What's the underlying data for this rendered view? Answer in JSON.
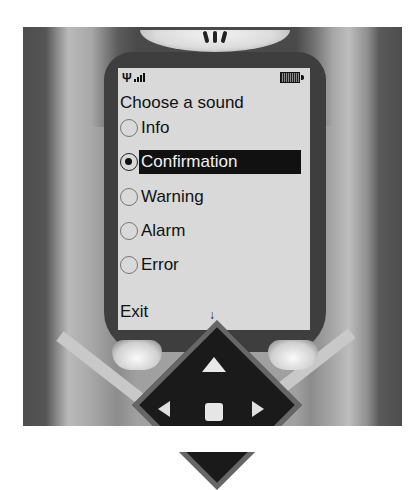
{
  "device": {
    "type": "mobile-phone",
    "earpiece_slots": 3
  },
  "status_bar": {
    "signal_icon": "antenna-icon",
    "signal_bars": 4,
    "battery_icon": "battery-icon",
    "battery_level": "full"
  },
  "screen": {
    "title": "Choose a sound",
    "options": [
      {
        "label": "Info",
        "selected": false
      },
      {
        "label": "Confirmation",
        "selected": true
      },
      {
        "label": "Warning",
        "selected": false
      },
      {
        "label": "Alarm",
        "selected": false
      },
      {
        "label": "Error",
        "selected": false
      }
    ],
    "softkey_left": "Exit",
    "scroll_indicator": "↓"
  },
  "keys": {
    "left_softkey": "left-softkey",
    "right_softkey": "right-softkey",
    "dpad_up": "▲",
    "dpad_left": "◀",
    "dpad_right": "▶",
    "dpad_center": "select"
  },
  "colors": {
    "screen_bg": "#d9d9d9",
    "selection_bg": "#111111",
    "selection_fg": "#f2f2f2",
    "bezel": "#3e3e3e"
  }
}
